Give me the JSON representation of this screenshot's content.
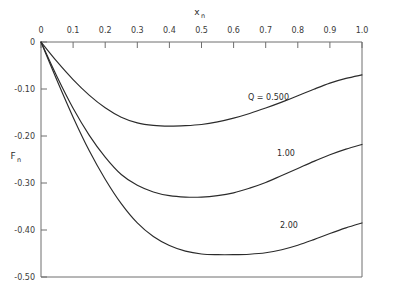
{
  "chart_data": {
    "type": "line",
    "title": "",
    "xlabel": "x_n",
    "ylabel": "F_n",
    "xlabel_base": "x",
    "xlabel_sub": "n",
    "ylabel_base": "F",
    "ylabel_sub": "n",
    "xlim": [
      0.0,
      1.0
    ],
    "ylim": [
      -0.5,
      0.0
    ],
    "grid": false,
    "legend_position": "inline-annotations",
    "x_ticks": [
      0.0,
      0.1,
      0.2,
      0.3,
      0.4,
      0.5,
      0.6,
      0.7,
      0.8,
      0.9,
      1.0
    ],
    "x_tick_labels": [
      "0",
      "0.1",
      "0.2",
      "0.3",
      "0.4",
      "0.5",
      "0.6",
      "0.7",
      "0.8",
      "0.9",
      "1.0"
    ],
    "y_ticks": [
      0.0,
      -0.1,
      -0.2,
      -0.3,
      -0.4,
      -0.5
    ],
    "y_tick_labels": [
      "0",
      "-0.10",
      "-0.20",
      "-0.30",
      "-0.40",
      "-0.50"
    ],
    "series": [
      {
        "name": "Q = 0.500",
        "label": "Q = 0.500",
        "label_x": 0.645,
        "label_y": -0.085,
        "minimum": {
          "x": 0.48,
          "y": -0.177
        },
        "endpoint": {
          "x": 1.0,
          "y": -0.07
        },
        "x": [
          0.0,
          0.05,
          0.1,
          0.15,
          0.2,
          0.25,
          0.3,
          0.35,
          0.4,
          0.45,
          0.5,
          0.55,
          0.6,
          0.65,
          0.7,
          0.75,
          0.8,
          0.85,
          0.9,
          0.95,
          1.0
        ],
        "values": [
          0.0,
          -0.042,
          -0.08,
          -0.113,
          -0.14,
          -0.16,
          -0.172,
          -0.1775,
          -0.179,
          -0.178,
          -0.1755,
          -0.17,
          -0.162,
          -0.152,
          -0.1405,
          -0.128,
          -0.1145,
          -0.1005,
          -0.0875,
          -0.0775,
          -0.07
        ]
      },
      {
        "name": "1.00",
        "label": "1.00",
        "label_x": 0.735,
        "label_y": -0.235,
        "minimum": {
          "x": 0.52,
          "y": -0.33
        },
        "endpoint": {
          "x": 1.0,
          "y": -0.218
        },
        "x": [
          0.0,
          0.05,
          0.1,
          0.15,
          0.2,
          0.25,
          0.3,
          0.35,
          0.4,
          0.45,
          0.5,
          0.55,
          0.6,
          0.65,
          0.7,
          0.75,
          0.8,
          0.85,
          0.9,
          0.95,
          1.0
        ],
        "values": [
          0.0,
          -0.074,
          -0.141,
          -0.198,
          -0.245,
          -0.282,
          -0.305,
          -0.319,
          -0.327,
          -0.33,
          -0.33,
          -0.327,
          -0.321,
          -0.311,
          -0.299,
          -0.284,
          -0.269,
          -0.254,
          -0.24,
          -0.228,
          -0.218
        ]
      },
      {
        "name": "2.00",
        "label": "2.00",
        "label_x": 0.745,
        "label_y": -0.375,
        "minimum": {
          "x": 0.655,
          "y": -0.452
        },
        "endpoint": {
          "x": 1.0,
          "y": -0.385
        },
        "x": [
          0.0,
          0.05,
          0.1,
          0.15,
          0.2,
          0.25,
          0.3,
          0.35,
          0.4,
          0.45,
          0.5,
          0.55,
          0.6,
          0.65,
          0.7,
          0.75,
          0.8,
          0.85,
          0.9,
          0.95,
          1.0
        ],
        "values": [
          0.0,
          -0.082,
          -0.16,
          -0.231,
          -0.292,
          -0.344,
          -0.385,
          -0.414,
          -0.433,
          -0.445,
          -0.451,
          -0.4525,
          -0.4525,
          -0.4515,
          -0.4485,
          -0.442,
          -0.4325,
          -0.4205,
          -0.4075,
          -0.3955,
          -0.385
        ]
      }
    ]
  }
}
